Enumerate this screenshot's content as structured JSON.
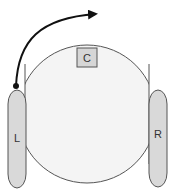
{
  "diagram": {
    "type": "robot-top-view",
    "body": {
      "fill": "#f4f4f4",
      "stroke": "#555555"
    },
    "center_component": {
      "label": "C",
      "fill": "#d6d6d6",
      "stroke": "#555555"
    },
    "left_wheel": {
      "label": "L",
      "fill": "#d9d9d9",
      "stroke": "#555555"
    },
    "right_wheel": {
      "label": "R",
      "fill": "#d9d9d9",
      "stroke": "#555555"
    },
    "rotation_arrow": {
      "color": "#111111",
      "direction": "clockwise",
      "pivot": "left-wheel-front"
    }
  }
}
